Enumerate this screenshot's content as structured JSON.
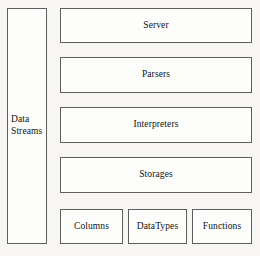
{
  "diagram": {
    "background_color": "#f7f6f4",
    "node_fill_color": "#fdfdfc",
    "node_border_color": "#5e5e5e",
    "text_color": "#111111",
    "sidebar": {
      "label": "Data\nStreams"
    },
    "layers": [
      {
        "id": "server",
        "label": "Server"
      },
      {
        "id": "parsers",
        "label": "Parsers"
      },
      {
        "id": "interpreters",
        "label": "Interpreters"
      },
      {
        "id": "storages",
        "label": "Storages"
      }
    ],
    "components": [
      {
        "id": "columns",
        "label": "Columns"
      },
      {
        "id": "datatypes",
        "label": "DataTypes"
      },
      {
        "id": "functions",
        "label": "Functions"
      }
    ]
  }
}
